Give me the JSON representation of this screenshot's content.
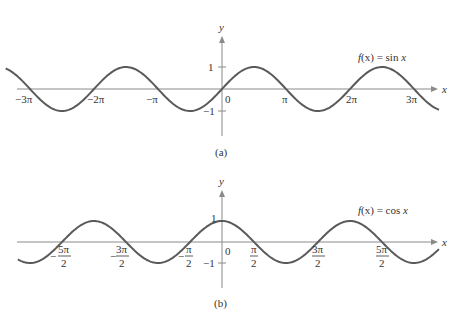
{
  "chart_data": [
    {
      "type": "line",
      "panel": "(a)",
      "title": "f(x) = sin x",
      "function": "sin",
      "xlabel": "x",
      "ylabel": "y",
      "x_range": [
        -3.38,
        3.39
      ],
      "x_range_unit": "pi",
      "ylim": [
        -1,
        1
      ],
      "x_tick_labels": [
        "−3π",
        "−2π",
        "−π",
        "0",
        "π",
        "2π",
        "3π"
      ],
      "y_tick_labels": [
        "1",
        "−1"
      ],
      "grid": false
    },
    {
      "type": "line",
      "panel": "(b)",
      "title": "f(x) = cos x",
      "function": "cos",
      "xlabel": "x",
      "ylabel": "y",
      "x_range": [
        -3.19,
        3.39
      ],
      "x_range_unit": "pi",
      "ylim": [
        -1,
        1
      ],
      "x_tick_labels": [
        "−5π/2",
        "−3π/2",
        "−π/2",
        "0",
        "π/2",
        "3π/2",
        "5π/2"
      ],
      "y_tick_labels": [
        "1",
        "−1"
      ],
      "grid": false
    }
  ],
  "panels": {
    "a": {
      "caption": "(a)",
      "func_prefix": "f",
      "func_arg": "(x) = sin ",
      "func_var": "x",
      "x_axis_label": "x",
      "y_axis_label": "y",
      "y_tick_pos": "1",
      "y_tick_neg": "−1",
      "origin": "0",
      "ticks": [
        "−3π",
        "−2π",
        "−π",
        "π",
        "2π",
        "3π"
      ]
    },
    "b": {
      "caption": "(b)",
      "func_prefix": "f",
      "func_arg": "(x) = cos ",
      "func_var": "x",
      "x_axis_label": "x",
      "y_axis_label": "y",
      "y_tick_pos": "1",
      "y_tick_neg": "−1",
      "origin": "0",
      "neg_fracs": [
        {
          "num": "5π",
          "den": "2"
        },
        {
          "num": "3π",
          "den": "2"
        },
        {
          "num": "π",
          "den": "2"
        }
      ],
      "pos_fracs": [
        {
          "num": "π",
          "den": "2"
        },
        {
          "num": "3π",
          "den": "2"
        },
        {
          "num": "5π",
          "den": "2"
        }
      ]
    }
  },
  "colors": {
    "curve": "#5a5a5a",
    "axis": "#8a8a8a",
    "text": "#333333"
  }
}
